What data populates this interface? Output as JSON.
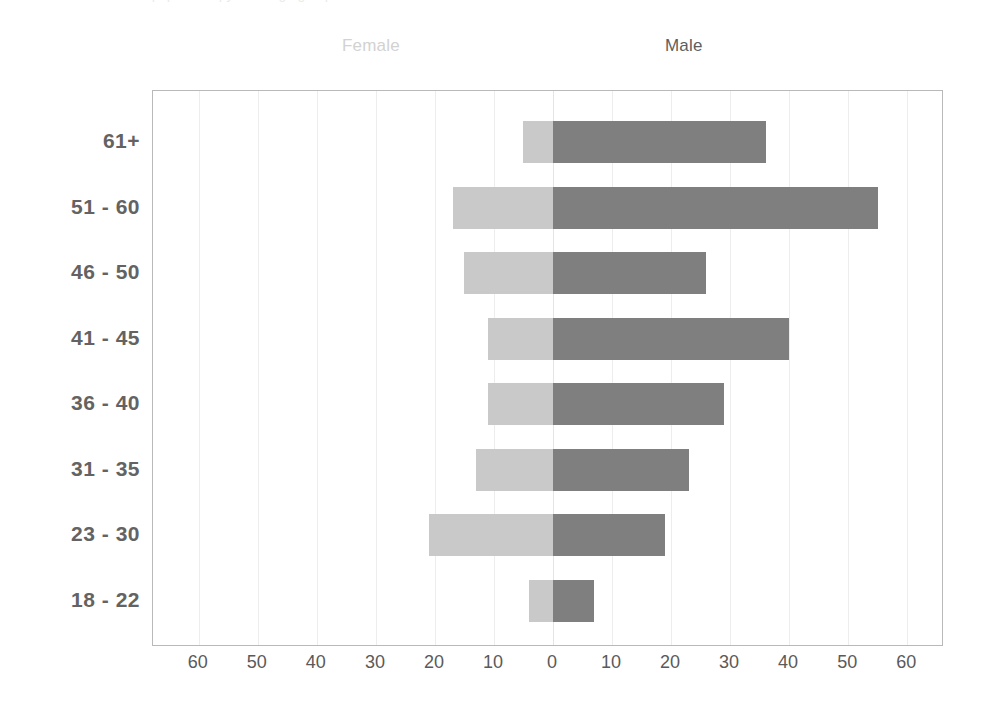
{
  "clipped_title": "population pyramid age groups",
  "legend": {
    "female_label": "Female",
    "female_color": "#c9c9c9",
    "male_label": "Male",
    "male_color": "#7f7f7f"
  },
  "axis": {
    "x_ticks": [
      "60",
      "50",
      "40",
      "30",
      "20",
      "10",
      "0",
      "10",
      "20",
      "30",
      "40",
      "50",
      "60"
    ],
    "x_tick_values": [
      -60,
      -50,
      -40,
      -30,
      -20,
      -10,
      0,
      10,
      20,
      30,
      40,
      50,
      60
    ],
    "x_min": -67,
    "x_max": 67,
    "grid": true
  },
  "chart_data": {
    "type": "bar",
    "subtype": "population-pyramid",
    "title": "",
    "xlabel": "",
    "ylabel": "",
    "categories": [
      "61+",
      "51 - 60",
      "46 - 50",
      "41 - 45",
      "36 - 40",
      "31 - 35",
      "23 - 30",
      "18 - 22"
    ],
    "series": [
      {
        "name": "Female",
        "side": "left",
        "color": "#c9c9c9",
        "values": [
          5,
          17,
          15,
          11,
          11,
          13,
          21,
          4
        ]
      },
      {
        "name": "Male",
        "side": "right",
        "color": "#7f7f7f",
        "values": [
          36,
          55,
          26,
          40,
          29,
          23,
          19,
          7
        ]
      }
    ],
    "xlim": [
      -67,
      67
    ],
    "xticks": [
      -60,
      -50,
      -40,
      -30,
      -20,
      -10,
      0,
      10,
      20,
      30,
      40,
      50,
      60
    ],
    "xticklabels": [
      "60",
      "50",
      "40",
      "30",
      "20",
      "10",
      "0",
      "10",
      "20",
      "30",
      "40",
      "50",
      "60"
    ],
    "legend_position": "top",
    "grid": true
  }
}
